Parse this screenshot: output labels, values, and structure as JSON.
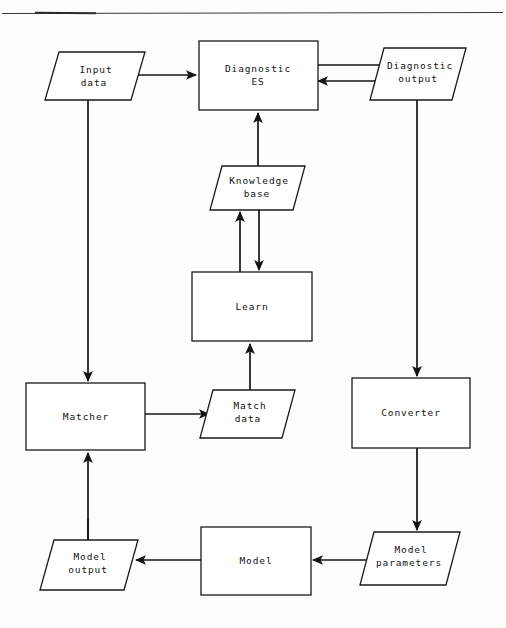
{
  "diagram": {
    "colors": {
      "stroke": "#141414",
      "fill": "#ffffff",
      "background": "#fdfdfc",
      "rule": "#3a3a3a"
    },
    "nodes": [
      {
        "id": "input-data",
        "shape": "parallelogram",
        "label_line1": "Input",
        "label_line2": "data"
      },
      {
        "id": "diagnostic-es",
        "shape": "rectangle",
        "label_line1": "Diagnostic",
        "label_line2": "ES"
      },
      {
        "id": "diagnostic-output",
        "shape": "parallelogram",
        "label_line1": "Diagnostic",
        "label_line2": "output"
      },
      {
        "id": "knowledge-base",
        "shape": "parallelogram",
        "label_line1": "Knowledge",
        "label_line2": "base"
      },
      {
        "id": "learn",
        "shape": "rectangle",
        "label_line1": "Learn",
        "label_line2": ""
      },
      {
        "id": "matcher",
        "shape": "rectangle",
        "label_line1": "Matcher",
        "label_line2": ""
      },
      {
        "id": "match-data",
        "shape": "parallelogram",
        "label_line1": "Match",
        "label_line2": "data"
      },
      {
        "id": "converter",
        "shape": "rectangle",
        "label_line1": "Converter",
        "label_line2": ""
      },
      {
        "id": "model-output",
        "shape": "parallelogram",
        "label_line1": "Model",
        "label_line2": "output"
      },
      {
        "id": "model",
        "shape": "rectangle",
        "label_line1": "Model",
        "label_line2": ""
      },
      {
        "id": "model-parameters",
        "shape": "parallelogram",
        "label_line1": "Model",
        "label_line2": "parameters"
      }
    ],
    "edges": [
      {
        "id": "input-to-es",
        "from": "input-data",
        "to": "diagnostic-es",
        "direction": "right"
      },
      {
        "id": "es-to-output",
        "from": "diagnostic-es",
        "to": "diagnostic-output",
        "direction": "right"
      },
      {
        "id": "output-to-es",
        "from": "diagnostic-output",
        "to": "diagnostic-es",
        "direction": "left"
      },
      {
        "id": "input-to-matcher",
        "from": "input-data",
        "to": "matcher",
        "direction": "down"
      },
      {
        "id": "output-to-converter",
        "from": "diagnostic-output",
        "to": "converter",
        "direction": "down"
      },
      {
        "id": "kb-to-es",
        "from": "knowledge-base",
        "to": "diagnostic-es",
        "direction": "up"
      },
      {
        "id": "kb-to-learn",
        "from": "knowledge-base",
        "to": "learn",
        "direction": "down"
      },
      {
        "id": "learn-to-kb",
        "from": "learn",
        "to": "knowledge-base",
        "direction": "up"
      },
      {
        "id": "matchdata-to-learn",
        "from": "match-data",
        "to": "learn",
        "direction": "up"
      },
      {
        "id": "matcher-to-matchdata",
        "from": "matcher",
        "to": "match-data",
        "direction": "right"
      },
      {
        "id": "modeloutput-to-matcher",
        "from": "model-output",
        "to": "matcher",
        "direction": "up"
      },
      {
        "id": "converter-to-params",
        "from": "converter",
        "to": "model-parameters",
        "direction": "down"
      },
      {
        "id": "params-to-model",
        "from": "model-parameters",
        "to": "model",
        "direction": "left"
      },
      {
        "id": "model-to-modeloutput",
        "from": "model",
        "to": "model-output",
        "direction": "left"
      },
      {
        "id": "modeloutput-down",
        "from": "model-output",
        "to": "model-output",
        "direction": "up"
      }
    ]
  }
}
